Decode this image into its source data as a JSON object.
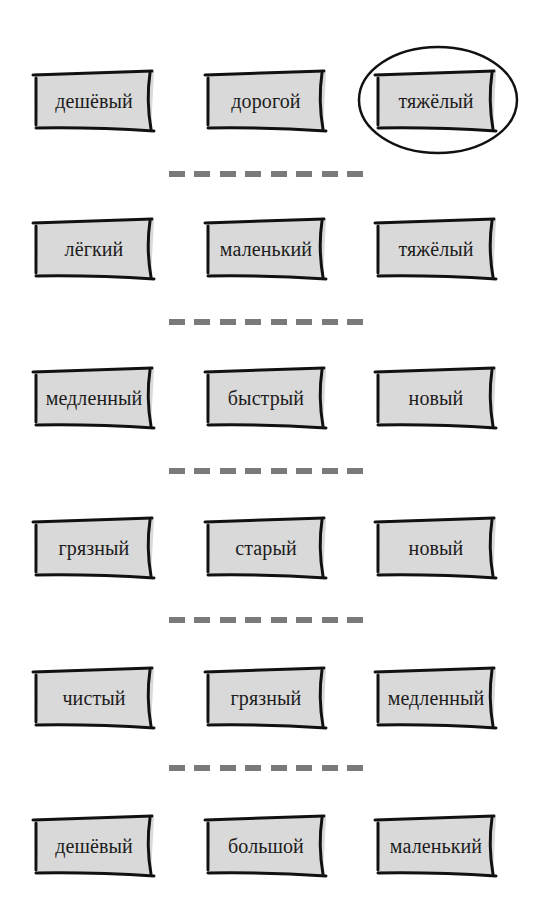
{
  "exercise": {
    "rows": [
      {
        "words": [
          "дешёвый",
          "дорогой",
          "тяжёлый"
        ],
        "circled_index": 2
      },
      {
        "words": [
          "лёгкий",
          "маленький",
          "тяжёлый"
        ],
        "circled_index": null
      },
      {
        "words": [
          "медленный",
          "быстрый",
          "новый"
        ],
        "circled_index": null
      },
      {
        "words": [
          "грязный",
          "старый",
          "новый"
        ],
        "circled_index": null
      },
      {
        "words": [
          "чистый",
          "грязный",
          "медленный"
        ],
        "circled_index": null
      },
      {
        "words": [
          "дешёвый",
          "большой",
          "маленький"
        ],
        "circled_index": null
      }
    ],
    "separator_dash_count": 8
  },
  "colors": {
    "card_fill": "#d9d9d9",
    "card_stroke": "#111111",
    "dash": "#7a7a7a",
    "circle_stroke": "#111111",
    "background": "#ffffff"
  }
}
